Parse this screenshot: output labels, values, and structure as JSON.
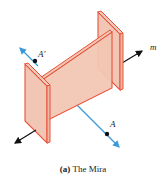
{
  "figure": {
    "labels": {
      "point_image": "A′",
      "point": "A",
      "line": "m"
    },
    "caption": {
      "tag": "(a)",
      "text": " The Mira"
    },
    "colors": {
      "plate_fill": "#f2c6b4",
      "plate_edge": "#e8523a",
      "reflection_line": "#3a9ad9",
      "axis_arrow": "#111111",
      "point": "#111111"
    }
  }
}
